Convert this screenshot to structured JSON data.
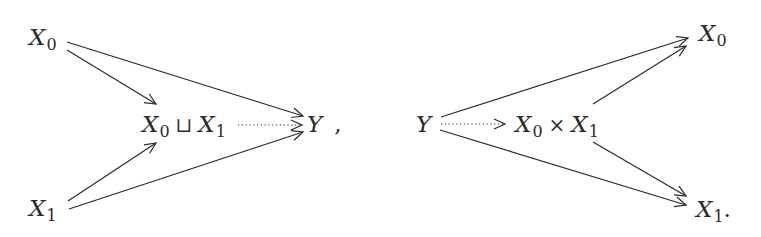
{
  "diagrams": [
    {
      "name": "coproduct",
      "nodes": {
        "x0": {
          "var": "X",
          "sub": "0"
        },
        "x1": {
          "var": "X",
          "sub": "1"
        },
        "center": {
          "left_var": "X",
          "left_sub": "0",
          "op": "⊔",
          "right_var": "X",
          "right_sub": "1"
        },
        "y": {
          "var": "Y",
          "trail": ","
        }
      },
      "edges": [
        {
          "from": "x0",
          "to": "center",
          "style": "solid"
        },
        {
          "from": "x0",
          "to": "y",
          "style": "solid"
        },
        {
          "from": "x1",
          "to": "center",
          "style": "solid"
        },
        {
          "from": "x1",
          "to": "y",
          "style": "solid"
        },
        {
          "from": "center",
          "to": "y",
          "style": "dotted"
        }
      ]
    },
    {
      "name": "product",
      "nodes": {
        "y": {
          "var": "Y"
        },
        "center": {
          "left_var": "X",
          "left_sub": "0",
          "op": "×",
          "right_var": "X",
          "right_sub": "1"
        },
        "x0": {
          "var": "X",
          "sub": "0"
        },
        "x1": {
          "var": "X",
          "sub": "1",
          "trail": "."
        }
      },
      "edges": [
        {
          "from": "y",
          "to": "x0",
          "style": "solid"
        },
        {
          "from": "y",
          "to": "x1",
          "style": "solid"
        },
        {
          "from": "center",
          "to": "x0",
          "style": "solid"
        },
        {
          "from": "center",
          "to": "x1",
          "style": "solid"
        },
        {
          "from": "y",
          "to": "center",
          "style": "dotted"
        }
      ]
    }
  ],
  "colors": {
    "ink": "#2a2a2a",
    "background": "#ffffff"
  }
}
